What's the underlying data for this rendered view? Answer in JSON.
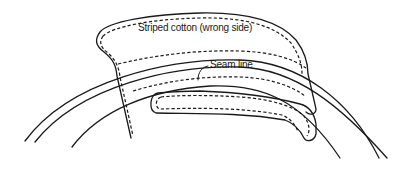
{
  "diagram": {
    "type": "sewing-illustration",
    "labels": {
      "fabric": "Striped cotton (wrong side)",
      "seam": "Seam line"
    },
    "colors": {
      "line": "#1a1a1a",
      "background": "#ffffff"
    },
    "elements": [
      "outer-curved-band",
      "inner-curve",
      "fabric-patch-top",
      "inner-rounded-slot",
      "seam-leader-line"
    ]
  }
}
